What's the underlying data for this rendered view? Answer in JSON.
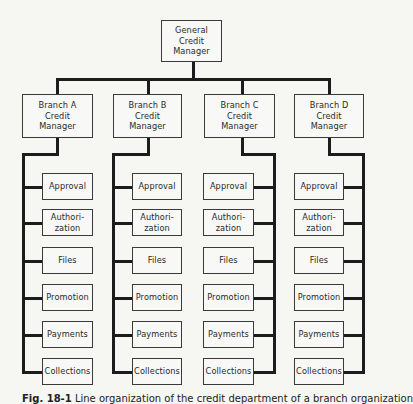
{
  "chart": {
    "root": {
      "label": "General\nCredit\nManager"
    },
    "branches": [
      {
        "label": "Branch A\nCredit\nManager"
      },
      {
        "label": "Branch B\nCredit\nManager"
      },
      {
        "label": "Branch C\nCredit\nManager"
      },
      {
        "label": "Branch D\nCredit\nManager"
      }
    ],
    "functions": [
      {
        "label": "Approval"
      },
      {
        "label": "Authori-\nzation"
      },
      {
        "label": "Files"
      },
      {
        "label": "Promotion"
      },
      {
        "label": "Payments"
      },
      {
        "label": "Collections"
      }
    ]
  },
  "caption": {
    "figure": "Fig. 18-1",
    "text": "Line organization of the credit department of a branch organization"
  },
  "colors": {
    "background": "#f6f6f3",
    "line": "#1c1c1c",
    "text": "#2a2a2a"
  }
}
